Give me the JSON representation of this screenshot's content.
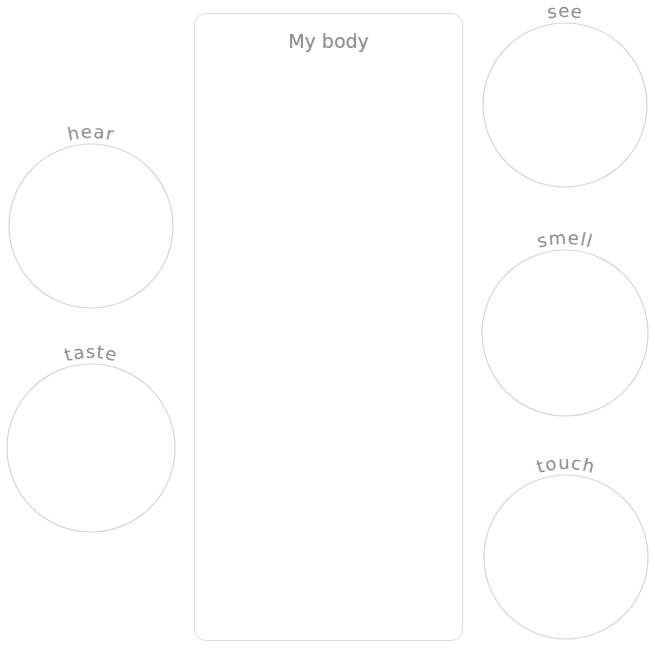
{
  "title": "My body",
  "senses": [
    {
      "id": "hear",
      "label": "hear",
      "cx": 91,
      "cy": 226,
      "r": 82
    },
    {
      "id": "taste",
      "label": "taste",
      "cx": 91,
      "cy": 448,
      "r": 84
    },
    {
      "id": "see",
      "label": "see",
      "cx": 565,
      "cy": 105,
      "r": 82
    },
    {
      "id": "smell",
      "label": "smell",
      "cx": 565,
      "cy": 333,
      "r": 83
    },
    {
      "id": "touch",
      "label": "touch",
      "cx": 566,
      "cy": 557,
      "r": 82
    }
  ]
}
